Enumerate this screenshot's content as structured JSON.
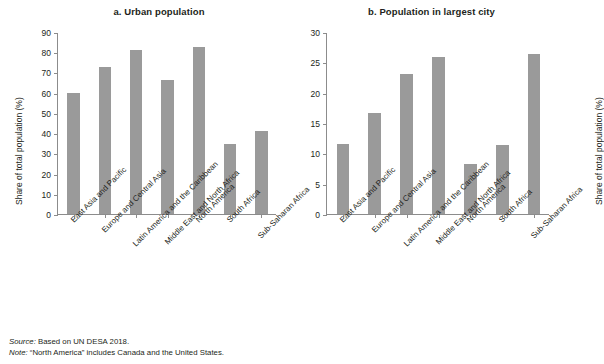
{
  "figure": {
    "source_lead": "Source:",
    "source_text": " Based on UN DESA 2018.",
    "note_lead": "Note:",
    "note_text": " “North America” includes Canada and the United States.",
    "bar_color": "#9a9a9a",
    "axis_color": "#8c8c8c",
    "text_color": "#231f20"
  },
  "chart_data": [
    {
      "type": "bar",
      "panel": "a",
      "title": "a. Urban population",
      "xlabel": "",
      "ylabel": "Share of total population (%)",
      "ylim": [
        0,
        90
      ],
      "yticks": [
        0,
        10,
        20,
        30,
        40,
        50,
        60,
        70,
        80,
        90
      ],
      "ytick_labels": [
        "0",
        "10",
        "20",
        "30",
        "40",
        "50",
        "60",
        "70",
        "80",
        "90"
      ],
      "grid": false,
      "legend": "none",
      "categories": [
        "East Asia and Pacific",
        "Europe and Central Asia",
        "Latin America and the Caribbean",
        "Middle East and North Africa",
        "North America",
        "South Africa",
        "Sub-Saharan Africa"
      ],
      "values": [
        60.0,
        72.6,
        81.2,
        66.2,
        82.5,
        34.6,
        41.2
      ]
    },
    {
      "type": "bar",
      "panel": "b",
      "title": "b. Population in largest city",
      "xlabel": "",
      "ylabel": "Share of total population (%)",
      "ylim": [
        0,
        30
      ],
      "yticks": [
        0,
        5,
        10,
        15,
        20,
        25,
        30
      ],
      "ytick_labels": [
        "0",
        "5",
        "10",
        "15",
        "20",
        "25",
        "30"
      ],
      "grid": false,
      "legend": "none",
      "categories": [
        "East Asia and Pacific",
        "Europe and Central Asia",
        "Latin America and the Caribbean",
        "Middle East and North Africa",
        "North America",
        "South Africa",
        "Sub-Saharan Africa"
      ],
      "values": [
        11.5,
        16.7,
        23.1,
        25.8,
        8.3,
        11.4,
        26.4
      ]
    }
  ]
}
